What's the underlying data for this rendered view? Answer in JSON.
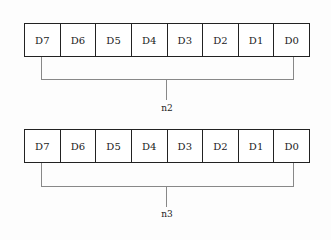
{
  "registers": [
    {
      "bits": [
        "D7",
        "D6",
        "D5",
        "D4",
        "D3",
        "D2",
        "D1",
        "D0"
      ],
      "label": "n2"
    },
    {
      "bits": [
        "D7",
        "D6",
        "D5",
        "D4",
        "D3",
        "D2",
        "D1",
        "D0"
      ],
      "label": "n3"
    }
  ]
}
